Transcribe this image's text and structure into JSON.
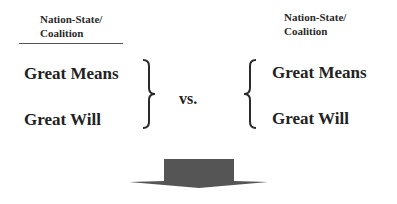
{
  "left": {
    "header_line1": "Nation-State/",
    "header_line2": "Coalition",
    "item1": "Great Means",
    "item2": "Great Will"
  },
  "connector": "vs.",
  "right": {
    "header_line1": "Nation-State/",
    "header_line2": "Coalition",
    "item1": "Great Means",
    "item2": "Great Will"
  },
  "arrow": {
    "direction": "down",
    "color": "#555555"
  }
}
